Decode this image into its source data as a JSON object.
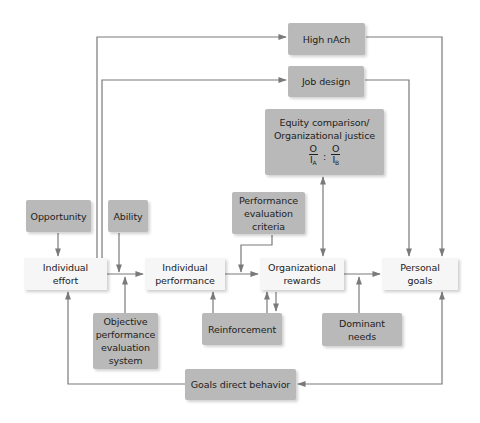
{
  "diagram": {
    "nodes": {
      "high_nach": "High nAch",
      "job_design": "Job design",
      "equity_line1": "Equity comparison/",
      "equity_line2": "Organizational justice",
      "equity_ratio_a_num": "O",
      "equity_ratio_a_den": "I",
      "equity_ratio_a_sub": "A",
      "equity_ratio_sep": ":",
      "equity_ratio_b_num": "O",
      "equity_ratio_b_den": "I",
      "equity_ratio_b_sub": "B",
      "opportunity": "Opportunity",
      "ability": "Ability",
      "performance_evaluation_criteria_1": "Performance",
      "performance_evaluation_criteria_2": "evaluation",
      "performance_evaluation_criteria_3": "criteria",
      "individual_effort_1": "Individual",
      "individual_effort_2": "effort",
      "individual_performance_1": "Individual",
      "individual_performance_2": "performance",
      "organizational_rewards_1": "Organizational",
      "organizational_rewards_2": "rewards",
      "personal_goals_1": "Personal",
      "personal_goals_2": "goals",
      "objective_1": "Objective",
      "objective_2": "performance",
      "objective_3": "evaluation",
      "objective_4": "system",
      "reinforcement": "Reinforcement",
      "dominant_needs_1": "Dominant",
      "dominant_needs_2": "needs",
      "goals_direct_behavior": "Goals direct behavior"
    },
    "colors": {
      "dark_box": "#b9b9b9",
      "light_box": "#f6f6f6",
      "line": "#7a7a7a"
    }
  }
}
